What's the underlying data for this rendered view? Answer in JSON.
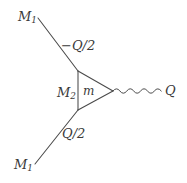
{
  "figure": {
    "type": "feynman-diagram",
    "background_color": "#ffffff",
    "line_color": "#4a4a4a",
    "text_color": "#3a3a3a",
    "width": 187,
    "height": 183
  },
  "labels": {
    "m1_top": {
      "base": "M",
      "sub": "1"
    },
    "momentum_upper": {
      "sign": "−",
      "base": "Q/2"
    },
    "m2_internal": {
      "base": "M",
      "sub": "2"
    },
    "m_loop": {
      "base": "m"
    },
    "q_out": {
      "base": "Q"
    },
    "momentum_lower": {
      "base": "Q/2"
    },
    "m1_bottom": {
      "base": "M",
      "sub": "1"
    }
  },
  "geometry": {
    "upper_external_line": {
      "x1": 38,
      "y1": 18,
      "x2": 78,
      "y2": 71
    },
    "lower_external_line": {
      "x1": 35,
      "y1": 164,
      "x2": 78,
      "y2": 110
    },
    "triangle": {
      "top_vertex": {
        "x": 78,
        "y": 71
      },
      "bottom_vertex": {
        "x": 78,
        "y": 110
      },
      "right_vertex": {
        "x": 113,
        "y": 91
      }
    },
    "photon_wave": {
      "start_x": 113,
      "end_x": 161,
      "center_y": 91,
      "amplitude": 3.6,
      "cycles": 7
    }
  }
}
